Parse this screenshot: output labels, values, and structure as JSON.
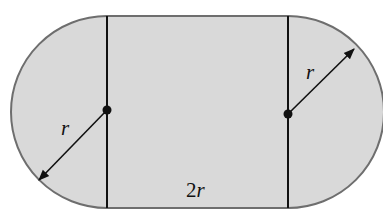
{
  "diagram": {
    "title": "",
    "shape": "stadium",
    "colors": {
      "fill": "#d9d9d9",
      "outline": "#6e6e6e",
      "lines": "#111111",
      "background": "#ffffff"
    },
    "labels": {
      "left_radius": "r",
      "right_radius": "r",
      "width_num": "2",
      "width_var": "r"
    },
    "geometry": {
      "radius_px": 96,
      "left_center": [
        107,
        112
      ],
      "right_center": [
        288,
        112
      ],
      "top_y": 16,
      "bottom_y": 208
    }
  }
}
